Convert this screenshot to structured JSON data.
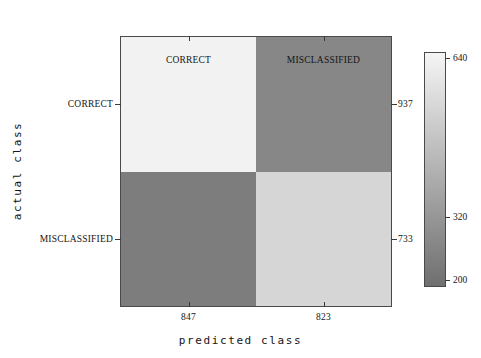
{
  "chart_data": {
    "type": "heatmap",
    "title": "",
    "xlabel": "predicted class",
    "ylabel": "actual class",
    "x_categories": [
      "CORRECT",
      "MISCLASSIFIED"
    ],
    "y_categories": [
      "CORRECT",
      "MISCLASSIFIED"
    ],
    "column_totals": [
      "847",
      "823"
    ],
    "row_totals": [
      "937",
      "733"
    ],
    "matrix": [
      [
        640,
        297
      ],
      [
        207,
        526
      ]
    ],
    "cell_colors": [
      [
        "#f2f2f2",
        "#878787"
      ],
      [
        "#7d7d7d",
        "#d6d6d6"
      ]
    ],
    "colorbar": {
      "ticks": [
        "640",
        "320",
        "200"
      ],
      "tick_positions_pct": [
        2,
        70.5,
        97.5
      ],
      "vmin": 200,
      "vmax": 640,
      "top_color": "#f5f5f5",
      "bottom_color": "#6f6f6f",
      "orientation": "vertical"
    },
    "grid": false,
    "legend": "colorbar-right"
  },
  "axes": {
    "top_ticks": [
      {
        "label": "CORRECT",
        "pos_pct": 25
      },
      {
        "label": "MISCLASSIFIED",
        "pos_pct": 75
      }
    ],
    "left_ticks": [
      {
        "label": "CORRECT",
        "pos_pct": 25
      },
      {
        "label": "MISCLASSIFIED",
        "pos_pct": 75
      }
    ],
    "right_ticks": [
      {
        "label": "937",
        "pos_pct": 25
      },
      {
        "label": "733",
        "pos_pct": 75
      }
    ],
    "bottom_ticks": [
      {
        "label": "847",
        "pos_pct": 25
      },
      {
        "label": "823",
        "pos_pct": 75
      }
    ]
  },
  "style": {
    "frame_color": "#4a4a4a",
    "tick_color": "#3a3a3a",
    "text_color": "#141414",
    "background": "#ffffff"
  }
}
